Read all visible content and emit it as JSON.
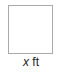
{
  "diagram": {
    "shape": "square",
    "border_color": "#a9a9a9",
    "fill_color": "#ffffff",
    "label": {
      "variable": "x",
      "unit": "ft"
    }
  }
}
